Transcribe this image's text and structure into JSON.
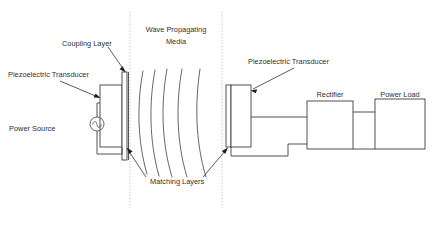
{
  "figure": {
    "caption_partial": "",
    "bg_color": "#ffffff",
    "line_color": "#3f3f3f",
    "boundary_color": "#b9b9b9"
  },
  "labels": {
    "coupling_layer": "Coupling Layer",
    "wave_media_line1": "Wave Propagating",
    "wave_media_line2": "Media",
    "piezo_left": "Piezoelectric Transducer",
    "piezo_right": "Piezoelectric Transducer",
    "power_source": "Power Source",
    "matching_layers": "Matching Layers",
    "rectifier": "Rectifier",
    "power_load": "Power Load"
  },
  "blocks": [
    {
      "name": "transmitter-piezo",
      "label": "Piezoelectric Transducer",
      "x": 100,
      "y": 85,
      "w": 22,
      "h": 62
    },
    {
      "name": "coupling-layer",
      "label": "Coupling Layer",
      "x": 122,
      "y": 72,
      "w": 5,
      "h": 88
    },
    {
      "name": "receiver-piezo",
      "label": "Piezoelectric Transducer",
      "x": 231,
      "y": 85,
      "w": 20,
      "h": 62
    },
    {
      "name": "matching-layer-right",
      "label": "Matching Layers",
      "x": 226,
      "y": 85,
      "w": 5,
      "h": 62
    },
    {
      "name": "rectifier",
      "label": "Rectifier",
      "x": 307,
      "y": 101,
      "w": 46,
      "h": 48
    },
    {
      "name": "power-load",
      "label": "Power Load",
      "x": 375,
      "y": 99,
      "w": 50,
      "h": 50
    }
  ],
  "wave_arcs": {
    "count": 5,
    "description": "five curved wavefront arcs propagating left to right"
  },
  "power_source": {
    "symbol": "ac-source-icon",
    "cx": 97,
    "cy": 124,
    "r": 7
  },
  "boundaries": [
    {
      "name": "media-left-boundary",
      "x": 130
    },
    {
      "name": "media-right-boundary",
      "x": 222
    }
  ],
  "colors": {
    "background": "#ffffff",
    "stroke": "#3f3f3f",
    "wave_stroke": "#4a4a4a",
    "boundary": "#b9b9b9",
    "text": "#2f2f2f"
  }
}
